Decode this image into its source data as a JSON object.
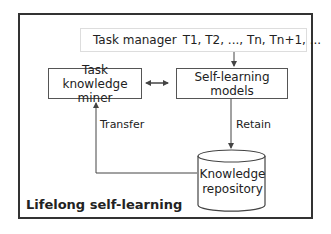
{
  "diagram": {
    "title": "Lifelong self-learning",
    "task_manager": {
      "label": "Task manager",
      "sequence": "T1, T2, ..., Tn, Tn+1, ..."
    },
    "nodes": {
      "miner": "Task knowledge miner",
      "models": "Self-learning models",
      "repository_line1": "Knowledge",
      "repository_line2": "repository"
    },
    "edges": {
      "transfer": "Transfer",
      "retain": "Retain"
    },
    "colors": {
      "border": "#333333",
      "light_border": "#dddddd",
      "text": "#222222"
    }
  }
}
